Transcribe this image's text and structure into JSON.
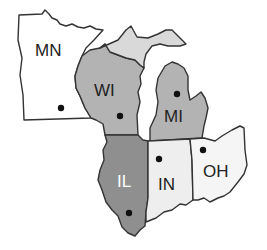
{
  "map": {
    "title": "Midwest states map",
    "states": [
      {
        "abbr": "MN",
        "fill": "#ffffff",
        "text_color": "#222222"
      },
      {
        "abbr": "WI",
        "fill": "#b3b3b3",
        "text_color": "#222222"
      },
      {
        "abbr": "MI",
        "fill": "#b3b3b3",
        "text_color": "#222222"
      },
      {
        "abbr": "MI_UP",
        "fill": "#d9d9d9",
        "text_color": "#222222"
      },
      {
        "abbr": "IL",
        "fill": "#8f8f8f",
        "text_color": "#ffffff"
      },
      {
        "abbr": "IN",
        "fill": "#eeeeee",
        "text_color": "#222222"
      },
      {
        "abbr": "OH",
        "fill": "#f5f5f5",
        "text_color": "#222222"
      }
    ],
    "labels": {
      "mn": "MN",
      "wi": "WI",
      "mi": "MI",
      "il": "IL",
      "in": "IN",
      "oh": "OH"
    },
    "legend_marker": "capital-dot"
  }
}
